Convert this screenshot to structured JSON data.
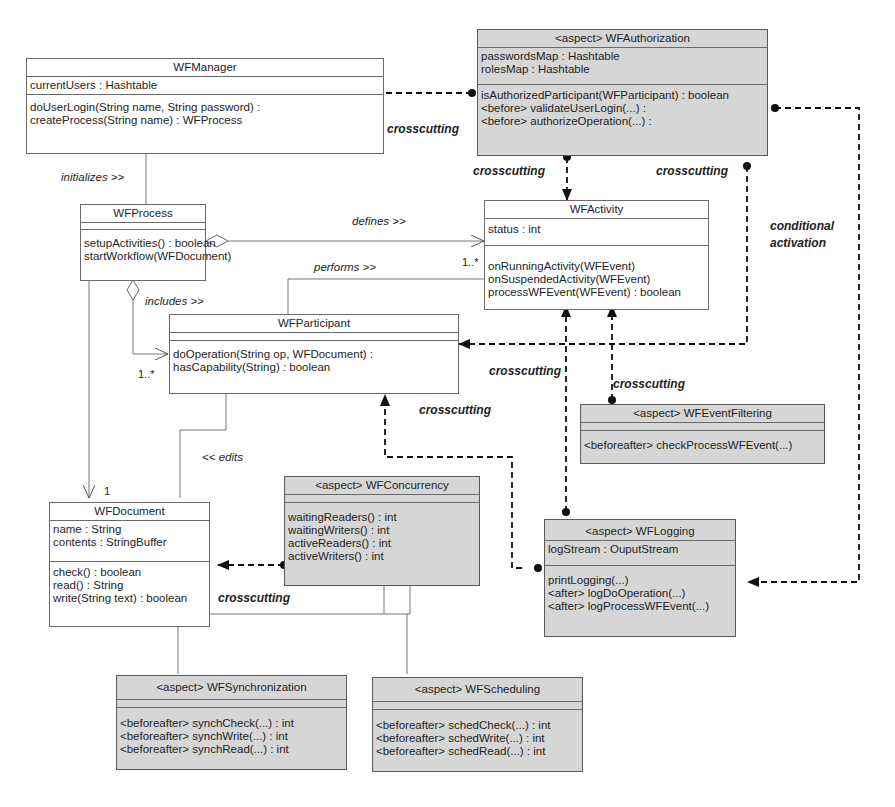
{
  "classes": {
    "wfmanager": {
      "name": "WFManager",
      "attributes": [
        "currentUsers : Hashtable"
      ],
      "operations": [
        "doUserLogin(String name, String password) :",
        "createProcess(String name) : WFProcess"
      ]
    },
    "wfauthorization": {
      "name": "<aspect> WFAuthorization",
      "attributes": [
        "passwordsMap : Hashtable",
        "rolesMap : Hashtable"
      ],
      "operations": [
        "isAuthorizedParticipant(WFParticipant) : boolean",
        "<before> validateUserLogin(...) :",
        "<before> authorizeOperation(...) :"
      ]
    },
    "wfprocess": {
      "name": "WFProcess",
      "attributes": [],
      "operations": [
        "setupActivities() : boolean",
        "startWorkflow(WFDocument)"
      ]
    },
    "wfactivity": {
      "name": "WFActivity",
      "attributes": [
        "status : int"
      ],
      "operations": [
        "onRunningActivity(WFEvent)",
        "onSuspendedActivity(WFEvent)",
        "processWFEvent(WFEvent) : boolean"
      ]
    },
    "wfparticipant": {
      "name": "WFParticipant",
      "attributes": [],
      "operations": [
        "doOperation(String op, WFDocument) :",
        "hasCapability(String) : boolean"
      ]
    },
    "wfeventfiltering": {
      "name": "<aspect> WFEventFiltering",
      "attributes": [],
      "operations": [
        "<beforeafter> checkProcessWFEvent(...)"
      ]
    },
    "wfdocument": {
      "name": "WFDocument",
      "attributes": [
        "name : String",
        "contents : StringBuffer"
      ],
      "operations": [
        "check() : boolean",
        "read() : String",
        "write(String text) : boolean"
      ]
    },
    "wfconcurrency": {
      "name": "<aspect> WFConcurrency",
      "attributes": [],
      "operations": [
        "waitingReaders() : int",
        "waitingWriters() : int",
        "activeReaders() : int",
        "activeWriters() : int"
      ]
    },
    "wflogging": {
      "name": "<aspect> WFLogging",
      "attributes": [
        "logStream : OuputStream"
      ],
      "operations": [
        "printLogging(...)",
        "<after> logDoOperation(...)",
        "<after> logProcessWFEvent(...)"
      ]
    },
    "wfsynchronization": {
      "name": "<aspect> WFSynchronization",
      "attributes": [],
      "operations": [
        "<beforeafter> synchCheck(...) : int",
        "<beforeafter> synchWrite(...) : int",
        "<beforeafter> synchRead(...) : int"
      ]
    },
    "wfscheduling": {
      "name": "<aspect> WFScheduling",
      "attributes": [],
      "operations": [
        "<beforeafter> schedCheck(...) : int",
        "<beforeafter> schedWrite(...) : int",
        "<beforeafter> schedRead(...) : int"
      ]
    }
  },
  "labels": {
    "initializes": "initializes >>",
    "defines": "defines >>",
    "performs": "performs >>",
    "includes": "includes >>",
    "edits": "<< edits",
    "crosscutting": "crosscutting",
    "conditional_activation_1": "conditional",
    "conditional_activation_2": "activation"
  },
  "multiplicities": {
    "defines_target": "1..*",
    "includes_target": "1..*",
    "document_target": "1"
  }
}
